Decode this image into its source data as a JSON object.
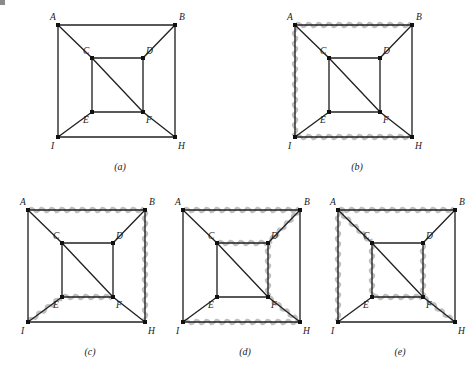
{
  "figure": {
    "background_color": "#ffffff",
    "edge_color": "#222222",
    "highlight_color": "#bfbfbf",
    "vertex_color": "#111111",
    "label_color": "#1a1a1a"
  },
  "graph": {
    "vertex_labels": [
      "A",
      "B",
      "C",
      "D",
      "E",
      "F",
      "I",
      "H"
    ],
    "vertices": {
      "A": {
        "label": "A",
        "x": 14,
        "y": 18,
        "label_dx": -8,
        "label_dy": -5
      },
      "B": {
        "label": "B",
        "x": 131,
        "y": 18,
        "label_dx": 4,
        "label_dy": -5
      },
      "C": {
        "label": "C",
        "x": 48,
        "y": 51,
        "label_dx": -9,
        "label_dy": -4
      },
      "D": {
        "label": "D",
        "x": 99,
        "y": 51,
        "label_dx": 3,
        "label_dy": -4
      },
      "E": {
        "label": "E",
        "x": 48,
        "y": 105,
        "label_dx": -9,
        "label_dy": 11
      },
      "F": {
        "label": "F",
        "x": 99,
        "y": 105,
        "label_dx": 3,
        "label_dy": 11
      },
      "I": {
        "label": "I",
        "x": 14,
        "y": 130,
        "label_dx": -7,
        "label_dy": 12
      },
      "H": {
        "label": "H",
        "x": 131,
        "y": 130,
        "label_dx": 3,
        "label_dy": 12
      }
    },
    "edges": [
      {
        "id": "A-B",
        "from": "A",
        "to": "B"
      },
      {
        "id": "A-I",
        "from": "A",
        "to": "I"
      },
      {
        "id": "B-H",
        "from": "B",
        "to": "H"
      },
      {
        "id": "I-H",
        "from": "I",
        "to": "H"
      },
      {
        "id": "C-D",
        "from": "C",
        "to": "D"
      },
      {
        "id": "C-E",
        "from": "C",
        "to": "E"
      },
      {
        "id": "D-F",
        "from": "D",
        "to": "F"
      },
      {
        "id": "E-F",
        "from": "E",
        "to": "F"
      },
      {
        "id": "A-C",
        "from": "A",
        "to": "C"
      },
      {
        "id": "B-D",
        "from": "B",
        "to": "D"
      },
      {
        "id": "I-E",
        "from": "I",
        "to": "E"
      },
      {
        "id": "F-H",
        "from": "F",
        "to": "H"
      },
      {
        "id": "C-F",
        "from": "C",
        "to": "F"
      }
    ]
  },
  "panels": [
    {
      "id": "a",
      "caption": "(a)",
      "left": 44,
      "top": 7,
      "width": 150,
      "height": 170,
      "caption_x": 76,
      "caption_y": 163,
      "highlighted_edges": []
    },
    {
      "id": "b",
      "caption": "(b)",
      "left": 281,
      "top": 7,
      "width": 150,
      "height": 170,
      "caption_x": 76,
      "caption_y": 163,
      "highlighted_edges": [
        "A-B",
        "A-I",
        "I-H"
      ]
    },
    {
      "id": "c",
      "caption": "(c)",
      "left": 14,
      "top": 192,
      "width": 150,
      "height": 170,
      "caption_x": 76,
      "caption_y": 163,
      "highlighted_edges": [
        "A-B",
        "B-H",
        "I-E",
        "E-F"
      ]
    },
    {
      "id": "d",
      "caption": "(d)",
      "left": 169,
      "top": 192,
      "width": 150,
      "height": 170,
      "caption_x": 76,
      "caption_y": 163,
      "highlighted_edges": [
        "A-B",
        "B-D",
        "C-D",
        "D-F",
        "F-H",
        "I-H"
      ]
    },
    {
      "id": "e",
      "caption": "(e)",
      "left": 324,
      "top": 192,
      "width": 150,
      "height": 170,
      "caption_x": 76,
      "caption_y": 163,
      "highlighted_edges": [
        "A-B",
        "A-I",
        "A-C",
        "C-E",
        "E-F",
        "D-F",
        "F-H"
      ]
    }
  ],
  "corner_mark": {
    "visible": true,
    "color": "#8a8a8a"
  }
}
